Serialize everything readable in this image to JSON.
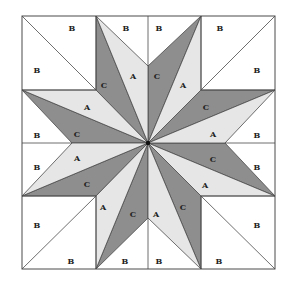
{
  "diagram": {
    "title": "",
    "type": "quilt-block-eight-point-star",
    "colors": {
      "background": "#ffffff",
      "piece_A": "#e6e6e6",
      "piece_B": "#ffffff",
      "piece_C": "#8e8e8e",
      "stroke": "#4a4a4a",
      "center_dot": "#111111"
    },
    "bounds": {
      "x0": 22,
      "y0": 16,
      "x1": 275,
      "y1": 269
    },
    "center": [
      148,
      143
    ],
    "pieces_C": [
      [
        [
          96,
          16
        ],
        [
          96,
          90
        ],
        [
          148,
          143
        ]
      ],
      [
        [
          201,
          16
        ],
        [
          148,
          66
        ],
        [
          148,
          143
        ]
      ],
      [
        [
          275,
          90
        ],
        [
          201,
          90
        ],
        [
          148,
          143
        ]
      ],
      [
        [
          275,
          196
        ],
        [
          225,
          143
        ],
        [
          148,
          143
        ]
      ],
      [
        [
          201,
          269
        ],
        [
          201,
          196
        ],
        [
          148,
          143
        ]
      ],
      [
        [
          96,
          269
        ],
        [
          148,
          218
        ],
        [
          148,
          143
        ]
      ],
      [
        [
          22,
          196
        ],
        [
          96,
          196
        ],
        [
          148,
          143
        ]
      ],
      [
        [
          22,
          90
        ],
        [
          72,
          143
        ],
        [
          148,
          143
        ]
      ]
    ],
    "pieces_A": [
      [
        [
          96,
          16
        ],
        [
          148,
          143
        ],
        [
          148,
          66
        ]
      ],
      [
        [
          201,
          16
        ],
        [
          148,
          143
        ],
        [
          201,
          90
        ]
      ],
      [
        [
          275,
          90
        ],
        [
          148,
          143
        ],
        [
          225,
          143
        ]
      ],
      [
        [
          275,
          196
        ],
        [
          148,
          143
        ],
        [
          201,
          196
        ]
      ],
      [
        [
          201,
          269
        ],
        [
          148,
          143
        ],
        [
          148,
          218
        ]
      ],
      [
        [
          96,
          269
        ],
        [
          148,
          143
        ],
        [
          96,
          196
        ]
      ],
      [
        [
          22,
          196
        ],
        [
          148,
          143
        ],
        [
          72,
          143
        ]
      ],
      [
        [
          22,
          90
        ],
        [
          148,
          143
        ],
        [
          96,
          90
        ]
      ]
    ],
    "lines": [
      [
        [
          22,
          16
        ],
        [
          96,
          90
        ]
      ],
      [
        [
          275,
          16
        ],
        [
          201,
          90
        ]
      ],
      [
        [
          22,
          269
        ],
        [
          96,
          196
        ]
      ],
      [
        [
          275,
          269
        ],
        [
          201,
          196
        ]
      ],
      [
        [
          96,
          16
        ],
        [
          96,
          90
        ]
      ],
      [
        [
          201,
          16
        ],
        [
          201,
          90
        ]
      ],
      [
        [
          96,
          269
        ],
        [
          96,
          196
        ]
      ],
      [
        [
          201,
          269
        ],
        [
          201,
          196
        ]
      ],
      [
        [
          22,
          90
        ],
        [
          96,
          90
        ]
      ],
      [
        [
          275,
          90
        ],
        [
          201,
          90
        ]
      ],
      [
        [
          22,
          196
        ],
        [
          96,
          196
        ]
      ],
      [
        [
          275,
          196
        ],
        [
          201,
          196
        ]
      ],
      [
        [
          148,
          16
        ],
        [
          148,
          66
        ]
      ],
      [
        [
          148,
          269
        ],
        [
          148,
          218
        ]
      ],
      [
        [
          22,
          143
        ],
        [
          72,
          143
        ]
      ],
      [
        [
          275,
          143
        ],
        [
          225,
          143
        ]
      ]
    ],
    "labels": [
      {
        "t": "B",
        "x": 72,
        "y": 28
      },
      {
        "t": "B",
        "x": 126,
        "y": 28
      },
      {
        "t": "B",
        "x": 159,
        "y": 28
      },
      {
        "t": "B",
        "x": 220,
        "y": 28
      },
      {
        "t": "B",
        "x": 37,
        "y": 70
      },
      {
        "t": "B",
        "x": 257,
        "y": 70
      },
      {
        "t": "C",
        "x": 104,
        "y": 85
      },
      {
        "t": "A",
        "x": 133,
        "y": 76
      },
      {
        "t": "C",
        "x": 157,
        "y": 76
      },
      {
        "t": "A",
        "x": 183,
        "y": 85
      },
      {
        "t": "A",
        "x": 87,
        "y": 107
      },
      {
        "t": "C",
        "x": 206,
        "y": 107
      },
      {
        "t": "B",
        "x": 37,
        "y": 135
      },
      {
        "t": "C",
        "x": 77,
        "y": 134
      },
      {
        "t": "A",
        "x": 213,
        "y": 134
      },
      {
        "t": "B",
        "x": 257,
        "y": 135
      },
      {
        "t": "A",
        "x": 77,
        "y": 158
      },
      {
        "t": "C",
        "x": 213,
        "y": 159
      },
      {
        "t": "B",
        "x": 37,
        "y": 167
      },
      {
        "t": "B",
        "x": 257,
        "y": 167
      },
      {
        "t": "C",
        "x": 87,
        "y": 184
      },
      {
        "t": "A",
        "x": 205,
        "y": 185
      },
      {
        "t": "A",
        "x": 103,
        "y": 207
      },
      {
        "t": "C",
        "x": 183,
        "y": 207
      },
      {
        "t": "C",
        "x": 133,
        "y": 214
      },
      {
        "t": "A",
        "x": 156,
        "y": 214
      },
      {
        "t": "B",
        "x": 37,
        "y": 225
      },
      {
        "t": "B",
        "x": 257,
        "y": 225
      },
      {
        "t": "B",
        "x": 71,
        "y": 261
      },
      {
        "t": "B",
        "x": 125,
        "y": 261
      },
      {
        "t": "B",
        "x": 159,
        "y": 261
      },
      {
        "t": "B",
        "x": 219,
        "y": 261
      }
    ]
  }
}
